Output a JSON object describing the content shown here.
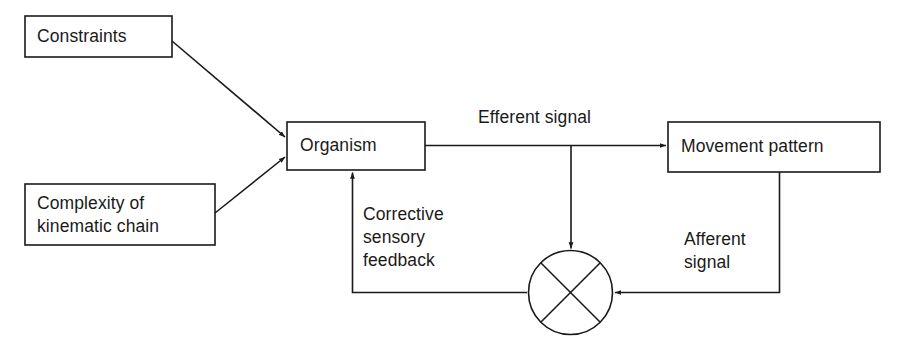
{
  "diagram": {
    "background_color": "#ffffff",
    "stroke_color": "#1a1a1a",
    "nodes": [
      {
        "id": "constraints",
        "label": "Constraints",
        "shape": "rectangle"
      },
      {
        "id": "complexity",
        "label": "Complexity of\nkinematic chain",
        "shape": "rectangle"
      },
      {
        "id": "organism",
        "label": "Organism",
        "shape": "rectangle"
      },
      {
        "id": "movement_pattern",
        "label": "Movement pattern",
        "shape": "rectangle"
      },
      {
        "id": "comparator",
        "label": "",
        "shape": "circle-with-cross"
      }
    ],
    "edge_labels": [
      {
        "id": "efferent",
        "label": "Efferent signal"
      },
      {
        "id": "afferent",
        "label": "Afferent\nsignal"
      },
      {
        "id": "corrective",
        "label": "Corrective\nsensory\nfeedback"
      }
    ],
    "edges": [
      {
        "from": "constraints",
        "to": "organism",
        "arrow": true,
        "label": ""
      },
      {
        "from": "complexity",
        "to": "organism",
        "arrow": true,
        "label": ""
      },
      {
        "from": "organism",
        "to": "movement_pattern",
        "arrow": true,
        "label": "Efferent signal"
      },
      {
        "from": "organism",
        "to": "comparator",
        "arrow": true,
        "label": ""
      },
      {
        "from": "movement_pattern",
        "to": "comparator",
        "arrow": true,
        "label": "Afferent signal"
      },
      {
        "from": "comparator",
        "to": "organism",
        "arrow": true,
        "label": "Corrective sensory feedback"
      }
    ]
  }
}
